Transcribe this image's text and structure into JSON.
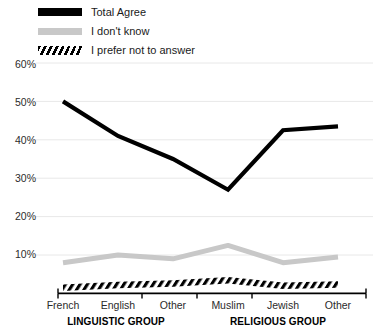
{
  "chart_data": {
    "type": "line",
    "title": "",
    "subtitle": "",
    "xlabel": "",
    "ylabel": "",
    "grid": true,
    "legend_position": "top-left",
    "ylim": [
      0,
      60
    ],
    "yticks": [
      10,
      20,
      30,
      40,
      50,
      60
    ],
    "ytick_labels": [
      "10%",
      "20%",
      "30%",
      "40%",
      "50%",
      "60%"
    ],
    "categories": [
      "French",
      "English",
      "Other",
      "Muslim",
      "Jewish",
      "Other"
    ],
    "group_labels": [
      "LINGUISTIC GROUP",
      "RELIGIOUS GROUP"
    ],
    "groups": [
      {
        "label": "LINGUISTIC GROUP",
        "categories": [
          "French",
          "English",
          "Other"
        ]
      },
      {
        "label": "RELIGIOUS GROUP",
        "categories": [
          "Muslim",
          "Jewish",
          "Other"
        ]
      }
    ],
    "series": [
      {
        "name": "Total Agree",
        "style": "solid-black",
        "color": "#000000",
        "values": [
          50,
          41,
          35,
          27,
          42.5,
          43.5
        ]
      },
      {
        "name": "I don't know",
        "style": "solid-gray",
        "color": "#c8c8c8",
        "values": [
          8,
          10,
          9,
          12.5,
          8,
          9.5
        ]
      },
      {
        "name": "I prefer not to answer",
        "style": "hatched",
        "color": "#000000",
        "values": [
          1.5,
          2.2,
          2.6,
          3.4,
          2.0,
          2.3
        ]
      }
    ]
  },
  "legend": {
    "items": [
      {
        "label": "Total Agree",
        "swatch": "solid-black-swatch"
      },
      {
        "label": "I don't know",
        "swatch": "solid-gray-swatch"
      },
      {
        "label": "I prefer not to answer",
        "swatch": "hatched-swatch"
      }
    ]
  },
  "axes": {
    "y_tick_labels": [
      "60%",
      "50%",
      "40%",
      "30%",
      "20%",
      "10%"
    ],
    "x_tick_labels": [
      "French",
      "English",
      "Other",
      "Muslim",
      "Jewish",
      "Other"
    ],
    "group_labels": [
      "LINGUISTIC GROUP",
      "RELIGIOUS GROUP"
    ]
  },
  "colors": {
    "series_total_agree": "#000000",
    "series_dont_know": "#c8c8c8",
    "series_prefer_not": "#000000",
    "gridline": "#e8e8e8",
    "axis": "#000000",
    "text": "#1a1a1a"
  }
}
